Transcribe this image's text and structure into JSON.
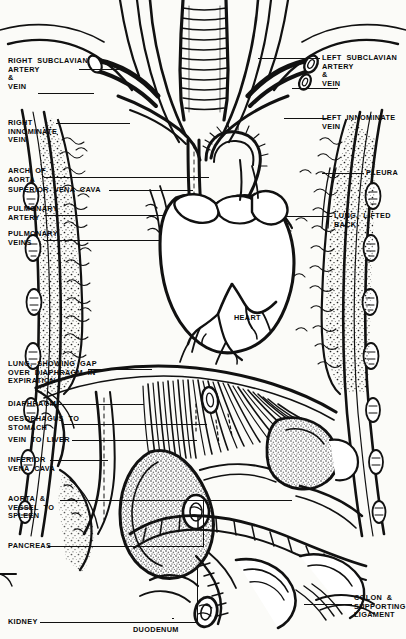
{
  "figure": {
    "style": "black and white engraved line art",
    "ink_color": "#111111",
    "paper_color": "#fbfbf8"
  },
  "labels_left": [
    {
      "name": "right-subclavian-artery-and-vein",
      "text": "RIGHT  SUBCLAVIAN\nARTERY\n&\nVEIN"
    },
    {
      "name": "right-innominate-vein",
      "text": "RIGHT\nINNOMINATE\nVEIN"
    },
    {
      "name": "arch-of-aorta",
      "text": "ARCH  OF\nAORTA"
    },
    {
      "name": "superior-vena-cava",
      "text": "SUPERIOR  VENA  CAVA"
    },
    {
      "name": "pulmonary-artery",
      "text": "PULMONARY\nARTERY"
    },
    {
      "name": "pulmonary-veins",
      "text": "PULMONARY\nVEINS"
    },
    {
      "name": "lung-showing-gap-over-diaphragm",
      "text": "LUNG,  SHOWING  GAP\nOVER  DIAPHRAGM  IN\nEXPIRATION"
    },
    {
      "name": "diaphragm",
      "text": "DIAPHRAGM"
    },
    {
      "name": "oesophagus-to-stomach",
      "text": "OESOPHAGUS  TO\nSTOMACH"
    },
    {
      "name": "vein-to-liver",
      "text": "VEIN  TO  LIVER"
    },
    {
      "name": "inferior-vena-cava",
      "text": "INFERIOR\nVENA  CAVA"
    },
    {
      "name": "aorta-and-vessel-to-spleen",
      "text": "AORTA  &\nVESSEL  TO\nSPLEEN"
    },
    {
      "name": "pancreas",
      "text": "PANCREAS"
    },
    {
      "name": "kidney",
      "text": "KIDNEY"
    }
  ],
  "labels_right": [
    {
      "name": "left-subclavian-artery-and-vein",
      "text": "LEFT  SUBCLAVIAN\nARTERY\n&\nVEIN"
    },
    {
      "name": "left-innominate-vein",
      "text": "LEFT  INNOMINATE\nVEIN"
    },
    {
      "name": "pleura",
      "text": "PLEURA"
    },
    {
      "name": "lung-lifted-back",
      "text": "LUNG,  LIFTED\nBACK"
    },
    {
      "name": "colon-and-supporting-ligament",
      "text": "COLON  &\nSUPPORTING\nLIGAMENT"
    }
  ],
  "labels_center": [
    {
      "name": "heart",
      "text": "HEART"
    },
    {
      "name": "duodenum",
      "text": "DUODENUM"
    }
  ]
}
